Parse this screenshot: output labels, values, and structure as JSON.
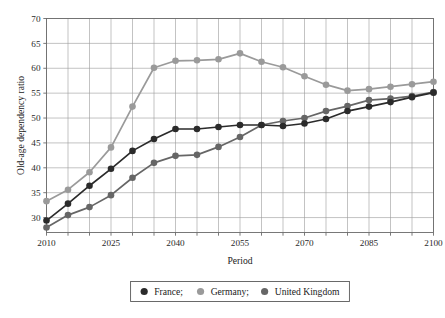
{
  "chart_data": {
    "type": "line",
    "title": "",
    "xlabel": "Period",
    "ylabel": "Old-age dependency ratio",
    "xlim": [
      2010,
      2100
    ],
    "ylim": [
      27,
      70
    ],
    "grid": true,
    "legend_position": "bottom",
    "x": [
      2010,
      2015,
      2020,
      2025,
      2030,
      2035,
      2040,
      2045,
      2050,
      2055,
      2060,
      2065,
      2070,
      2075,
      2080,
      2085,
      2090,
      2095,
      2100
    ],
    "x_ticks": [
      2010,
      2025,
      2040,
      2055,
      2070,
      2085,
      2100
    ],
    "y_ticks": [
      30,
      35,
      40,
      45,
      50,
      55,
      60,
      65,
      70
    ],
    "series": [
      {
        "name": "France;",
        "color": "#2b2b2b",
        "values": [
          29.4,
          32.8,
          36.4,
          39.8,
          43.4,
          45.8,
          47.8,
          47.8,
          48.2,
          48.6,
          48.6,
          48.4,
          48.9,
          49.8,
          51.4,
          52.3,
          53.2,
          54.2,
          55.1
        ]
      },
      {
        "name": "Germany;",
        "color": "#9a9a9a",
        "values": [
          33.3,
          35.6,
          39.1,
          44.1,
          52.3,
          60.1,
          61.5,
          61.6,
          61.8,
          63.0,
          61.3,
          60.2,
          58.4,
          56.7,
          55.5,
          55.8,
          56.3,
          56.8,
          57.3
        ]
      },
      {
        "name": "United Kingdom",
        "color": "#666666",
        "values": [
          28.0,
          30.5,
          32.1,
          34.5,
          38.0,
          41.0,
          42.4,
          42.6,
          44.2,
          46.2,
          48.6,
          49.4,
          50.0,
          51.4,
          52.4,
          53.6,
          53.9,
          54.4,
          55.2
        ]
      }
    ],
    "x_tick_count": 19,
    "marker": "circle",
    "marker_size": 3.3
  },
  "axes": {
    "xlabel": "Period",
    "ylabel": "Old-age dependency ratio"
  },
  "legend": {
    "entries": [
      {
        "label": "France;",
        "color": "#2b2b2b",
        "marker": "filled-circle"
      },
      {
        "label": "Germany;",
        "color": "#9a9a9a",
        "marker": "filled-circle"
      },
      {
        "label": "United Kingdom",
        "color": "#666666",
        "marker": "filled-circle"
      }
    ]
  }
}
